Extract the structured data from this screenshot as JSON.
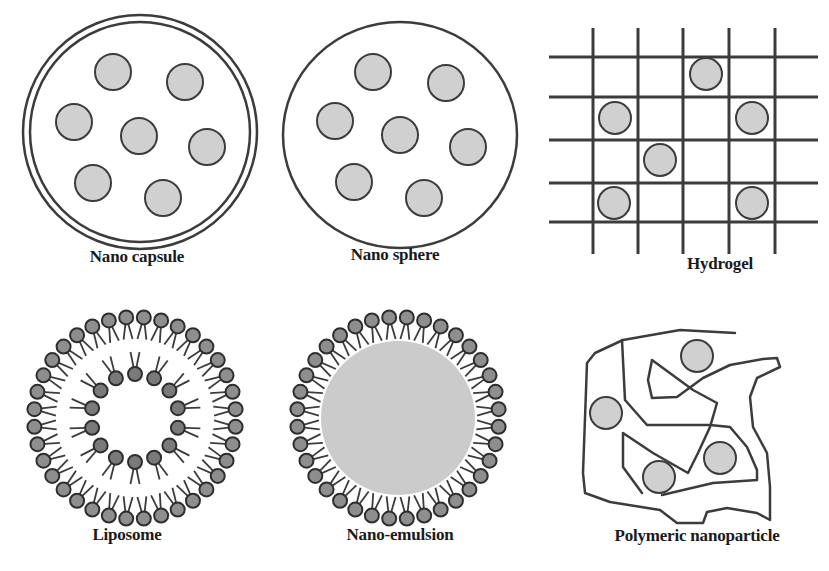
{
  "figure": {
    "colors": {
      "stroke": "#3c3c3c",
      "particle_fill": "#d0d0d0",
      "head_outer_fill": "#8e8e8e",
      "head_inner_fill": "#7a7a7a",
      "emulsion_core": "#cbcbcb",
      "background": "#ffffff"
    },
    "panels": [
      {
        "id": "nano-capsule",
        "label": "Nano capsule",
        "label_pos": [
          137,
          257
        ],
        "shell": {
          "cx": 140,
          "cy": 132,
          "r_outer": 117,
          "r_inner": 110
        },
        "particles": [
          [
            113,
            72
          ],
          [
            185,
            82
          ],
          [
            74,
            122
          ],
          [
            139,
            136
          ],
          [
            207,
            147
          ],
          [
            93,
            183
          ],
          [
            163,
            198
          ]
        ],
        "particle_r": 18
      },
      {
        "id": "nano-sphere",
        "label": "Nano sphere",
        "label_pos": [
          395,
          255
        ],
        "shell": {
          "cx": 400,
          "cy": 135,
          "rx": 117,
          "ry": 113
        },
        "particles": [
          [
            373,
            72
          ],
          [
            446,
            83
          ],
          [
            335,
            121
          ],
          [
            400,
            135
          ],
          [
            468,
            147
          ],
          [
            354,
            182
          ],
          [
            424,
            198
          ]
        ],
        "particle_r": 18
      },
      {
        "id": "hydrogel",
        "label": "Hydrogel",
        "label_pos": [
          720,
          264
        ],
        "grid": {
          "vertical_x": [
            593,
            638,
            683,
            729,
            775
          ],
          "vertical_y": [
            28,
            254
          ],
          "horizontal_y": [
            57,
            97,
            140,
            183,
            222
          ],
          "horizontal_x": [
            549,
            818
          ]
        },
        "particles": [
          [
            706,
            74
          ],
          [
            615,
            118
          ],
          [
            752,
            118
          ],
          [
            660,
            160
          ],
          [
            614,
            203
          ],
          [
            752,
            203
          ]
        ],
        "particle_r": 16
      },
      {
        "id": "liposome",
        "label": "Liposome",
        "label_pos": [
          127,
          535
        ],
        "center": [
          135,
          418
        ],
        "outer_ring": {
          "r": 101,
          "count": 36,
          "head_r": 7,
          "tail_len": 15
        },
        "inner_ring": {
          "r": 44,
          "count": 14,
          "head_r": 7,
          "tail_len": 15
        }
      },
      {
        "id": "nano-emulsion",
        "label": "Nano-emulsion",
        "label_pos": [
          400,
          535
        ],
        "center": [
          398,
          418
        ],
        "core_r": 77,
        "outer_ring": {
          "r": 101,
          "count": 36,
          "head_r": 7,
          "tail_len": 15
        }
      },
      {
        "id": "polymeric-nanoparticle",
        "label": "Polymeric nanoparticle",
        "label_pos": [
          697,
          536
        ],
        "chains": [
          [
            [
              735,
              333
            ],
            [
              680,
              330
            ],
            [
              623,
              340
            ],
            [
              595,
              353
            ],
            [
              587,
              363
            ],
            [
              583,
              473
            ],
            [
              585,
              493
            ],
            [
              610,
              502
            ],
            [
              660,
              510
            ],
            [
              677,
              523
            ],
            [
              703,
              523
            ],
            [
              707,
              512
            ],
            [
              727,
              508
            ],
            [
              757,
              513
            ],
            [
              770,
              520
            ],
            [
              770,
              487
            ],
            [
              767,
              453
            ],
            [
              753,
              427
            ],
            [
              750,
              397
            ],
            [
              757,
              378
            ],
            [
              780,
              367
            ],
            [
              777,
              358
            ],
            [
              763,
              359
            ],
            [
              730,
              365
            ],
            [
              703,
              378
            ],
            [
              677,
              397
            ],
            [
              652,
              398
            ],
            [
              648,
              380
            ],
            [
              652,
              360
            ],
            [
              693,
              390
            ],
            [
              717,
              403
            ],
            [
              710,
              427
            ],
            [
              698,
              453
            ],
            [
              688,
              473
            ],
            [
              653,
              453
            ],
            [
              623,
              433
            ],
            [
              623,
              467
            ],
            [
              642,
              493
            ]
          ],
          [
            [
              622,
              340
            ],
            [
              625,
              400
            ],
            [
              647,
              425
            ],
            [
              710,
              425
            ],
            [
              730,
              427
            ],
            [
              747,
              447
            ],
            [
              757,
              470
            ],
            [
              757,
              480
            ],
            [
              713,
              483
            ],
            [
              662,
              495
            ]
          ]
        ],
        "particles": [
          [
            697,
            356
          ],
          [
            606,
            413
          ],
          [
            720,
            458
          ],
          [
            659,
            477
          ]
        ],
        "particle_r": 16
      }
    ]
  }
}
